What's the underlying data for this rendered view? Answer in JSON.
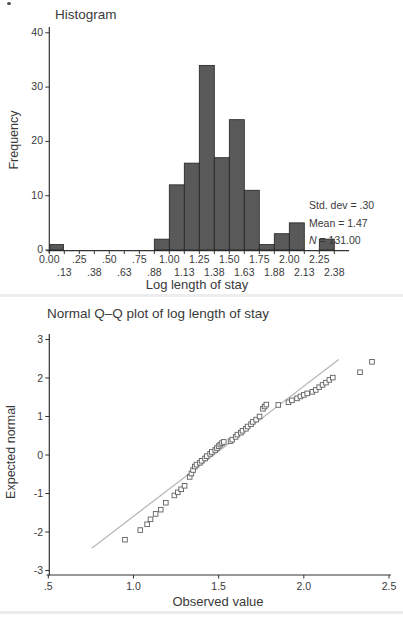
{
  "page": {
    "background": "#ffffff",
    "ink": "#3a3a3a"
  },
  "histogram": {
    "title": "Histogram",
    "ylabel": "Frequency",
    "xlabel": "Log length of stay",
    "stats": {
      "std_dev": "Std. dev = .30",
      "mean": "Mean = 1.47",
      "n_label": "N",
      "n_value": " = 131.00"
    }
  },
  "qqplot": {
    "title": "Normal Q–Q plot of log length of stay",
    "ylabel": "Expected normal",
    "xlabel": "Observed value"
  },
  "chart_data": [
    {
      "type": "bar",
      "title": "Histogram",
      "xlabel": "Log length of stay",
      "ylabel": "Frequency",
      "categories": [
        "0.00",
        ".13",
        ".25",
        ".38",
        ".50",
        ".63",
        ".75",
        ".88",
        "1.00",
        "1.13",
        "1.25",
        "1.38",
        "1.50",
        "1.63",
        "1.75",
        "1.88",
        "2.00",
        "2.13",
        "2.25",
        "2.38"
      ],
      "values": [
        1,
        0,
        0,
        0,
        0,
        0,
        0,
        0,
        2,
        12,
        16,
        34,
        17,
        24,
        11,
        1,
        3,
        5,
        0,
        2
      ],
      "ylim": [
        0,
        40
      ],
      "yticks": [
        0,
        10,
        20,
        30,
        40
      ],
      "grid": false,
      "bar_color": "#595959",
      "bar_edge": "#222222",
      "annotations": [
        "Std. dev = .30",
        "Mean = 1.47",
        "N = 131.00"
      ]
    },
    {
      "type": "scatter",
      "title": "Normal Q–Q plot of log length of stay",
      "xlabel": "Observed value",
      "ylabel": "Expected normal",
      "xlim": [
        0.5,
        2.5
      ],
      "ylim": [
        -3,
        3
      ],
      "xticks": [
        0.5,
        1.0,
        1.5,
        2.0,
        2.5
      ],
      "xtick_labels": [
        ".5",
        "1.0",
        "1.5",
        "2.0",
        "2.5"
      ],
      "yticks": [
        -3,
        -2,
        -1,
        0,
        1,
        2,
        3
      ],
      "grid": false,
      "marker": "open-square",
      "marker_color": "#5f5f5f",
      "ref_line": {
        "x1": 0.755,
        "y1": -2.42,
        "x2": 2.205,
        "y2": 2.48,
        "color": "#b8b8b8"
      },
      "points": [
        [
          0.95,
          -2.2
        ],
        [
          1.04,
          -1.95
        ],
        [
          1.08,
          -1.8
        ],
        [
          1.1,
          -1.67
        ],
        [
          1.13,
          -1.53
        ],
        [
          1.16,
          -1.42
        ],
        [
          1.19,
          -1.24
        ],
        [
          1.24,
          -1.05
        ],
        [
          1.26,
          -0.97
        ],
        [
          1.28,
          -0.89
        ],
        [
          1.3,
          -0.8
        ],
        [
          1.33,
          -0.57
        ],
        [
          1.34,
          -0.48
        ],
        [
          1.35,
          -0.39
        ],
        [
          1.36,
          -0.3
        ],
        [
          1.37,
          -0.25
        ],
        [
          1.39,
          -0.2
        ],
        [
          1.4,
          -0.15
        ],
        [
          1.42,
          -0.09
        ],
        [
          1.43,
          -0.03
        ],
        [
          1.45,
          0.03
        ],
        [
          1.46,
          0.08
        ],
        [
          1.48,
          0.13
        ],
        [
          1.49,
          0.18
        ],
        [
          1.5,
          0.23
        ],
        [
          1.51,
          0.27
        ],
        [
          1.52,
          0.31
        ],
        [
          1.53,
          0.34
        ],
        [
          1.57,
          0.36
        ],
        [
          1.58,
          0.4
        ],
        [
          1.6,
          0.47
        ],
        [
          1.61,
          0.53
        ],
        [
          1.63,
          0.58
        ],
        [
          1.64,
          0.63
        ],
        [
          1.66,
          0.68
        ],
        [
          1.67,
          0.74
        ],
        [
          1.69,
          0.8
        ],
        [
          1.7,
          0.86
        ],
        [
          1.72,
          0.92
        ],
        [
          1.74,
          1.0
        ],
        [
          1.76,
          1.2
        ],
        [
          1.77,
          1.26
        ],
        [
          1.78,
          1.31
        ],
        [
          1.85,
          1.3
        ],
        [
          1.91,
          1.37
        ],
        [
          1.93,
          1.42
        ],
        [
          1.96,
          1.47
        ],
        [
          1.98,
          1.52
        ],
        [
          2.0,
          1.56
        ],
        [
          2.02,
          1.6
        ],
        [
          2.05,
          1.64
        ],
        [
          2.07,
          1.69
        ],
        [
          2.09,
          1.76
        ],
        [
          2.11,
          1.82
        ],
        [
          2.13,
          1.88
        ],
        [
          2.15,
          1.95
        ],
        [
          2.17,
          2.01
        ],
        [
          2.33,
          2.15
        ],
        [
          2.4,
          2.42
        ]
      ]
    }
  ]
}
